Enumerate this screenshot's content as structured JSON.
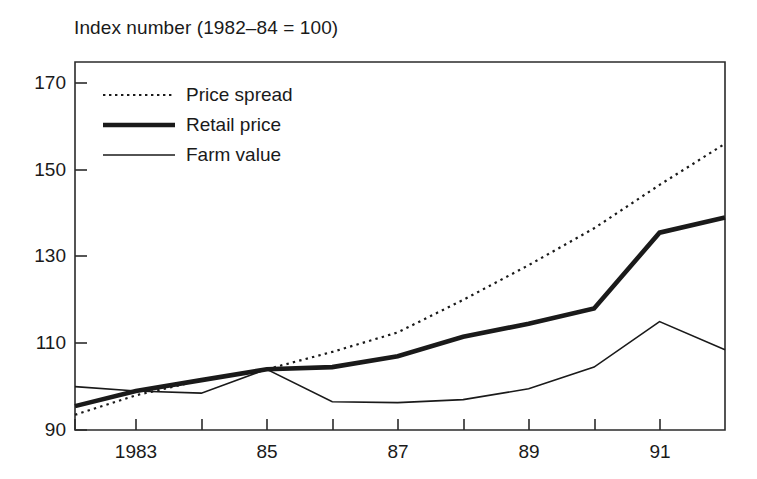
{
  "chart_data": {
    "type": "line",
    "title": "Index number (1982–84 = 100)",
    "xlabel": "",
    "ylabel": "",
    "xlim": [
      1982.07,
      1992.0
    ],
    "ylim": [
      90,
      175
    ],
    "grid": false,
    "legend_position": "top-left inside axes",
    "yticks": [
      90,
      110,
      130,
      150,
      170
    ],
    "ytick_labels": [
      "90",
      "110",
      "130",
      "150",
      "170"
    ],
    "xticks": [
      1982,
      1983,
      1984,
      1985,
      1986,
      1987,
      1988,
      1989,
      1990,
      1991
    ],
    "xtick_labels": [
      "",
      "1983",
      "",
      "85",
      "",
      "87",
      "",
      "89",
      "",
      "91"
    ],
    "series": [
      {
        "name": "Price spread",
        "style": "dotted",
        "x": [
          1982.07,
          1983,
          1984,
          1985,
          1986,
          1987,
          1988,
          1989,
          1990,
          1991,
          1992
        ],
        "values": [
          93.5,
          98.0,
          101.5,
          104.0,
          108.0,
          112.5,
          120.0,
          128.0,
          136.5,
          146.5,
          156.0
        ]
      },
      {
        "name": "Retail price",
        "style": "thick-solid",
        "x": [
          1982.07,
          1983,
          1984,
          1985,
          1986,
          1987,
          1988,
          1989,
          1990,
          1991,
          1992
        ],
        "values": [
          95.5,
          99.0,
          101.5,
          104.0,
          104.5,
          107.0,
          111.5,
          114.5,
          118.0,
          135.5,
          139.0
        ]
      },
      {
        "name": "Farm value",
        "style": "thin-solid",
        "x": [
          1982.07,
          1983,
          1984,
          1985,
          1986,
          1987,
          1988,
          1989,
          1990,
          1991,
          1992
        ],
        "values": [
          100.0,
          99.0,
          98.5,
          104.0,
          96.5,
          96.3,
          97.0,
          99.5,
          104.5,
          115.0,
          108.5
        ]
      }
    ]
  },
  "legend": {
    "items": [
      {
        "label": "Price spread",
        "marker": "dotted-line-swatch"
      },
      {
        "label": "Retail price",
        "marker": "thick-line-swatch"
      },
      {
        "label": "Farm value",
        "marker": "thin-line-swatch"
      }
    ]
  },
  "colors": {
    "ink": "#1a1a1a",
    "axis": "#2b2b2b",
    "background": "#ffffff"
  }
}
